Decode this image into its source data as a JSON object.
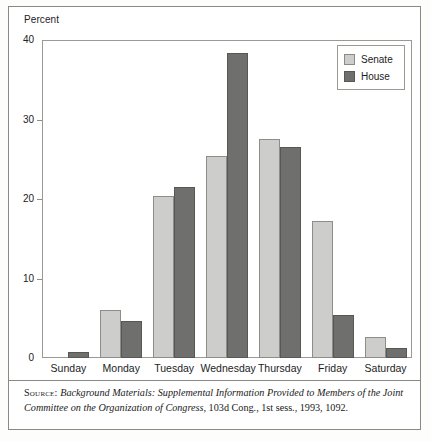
{
  "figure": {
    "y_axis_title": "Percent",
    "source_label": "Source:",
    "source_italic": "Background Materials: Supplemental Information Provided to Members of the Joint Committee on the Organization of Congress,",
    "source_tail": " 103d Cong., 1st sess., 1993, 1092."
  },
  "legend": {
    "position": "top-right",
    "entries": [
      {
        "label": "Senate",
        "color": "#cdcdcb"
      },
      {
        "label": "House",
        "color": "#6f6f6d"
      }
    ]
  },
  "chart_data": {
    "type": "bar",
    "title": "",
    "subtitle": "",
    "xlabel": "",
    "ylabel": "Percent",
    "ylim": [
      0,
      40
    ],
    "yticks": [
      0,
      10,
      20,
      30,
      40
    ],
    "ytick_labels": [
      "0",
      "10",
      "20",
      "30",
      "40"
    ],
    "grid": false,
    "legend_position": "top-right",
    "categories": [
      "Sunday",
      "Monday",
      "Tuesday",
      "Wednesday",
      "Thursday",
      "Friday",
      "Saturday"
    ],
    "series": [
      {
        "name": "Senate",
        "color": "#cdcdcb",
        "values": [
          0,
          6.0,
          20.4,
          25.4,
          27.5,
          17.2,
          2.7
        ]
      },
      {
        "name": "House",
        "color": "#6f6f6d",
        "values": [
          0.7,
          4.7,
          21.5,
          38.4,
          26.5,
          5.4,
          1.3
        ]
      }
    ]
  }
}
